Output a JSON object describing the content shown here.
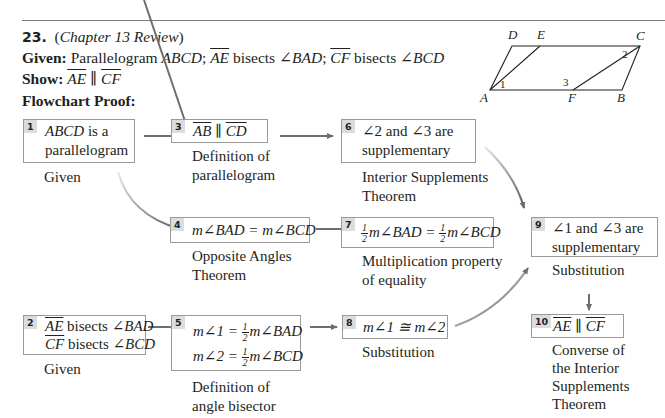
{
  "problem": {
    "number": "23.",
    "chapter_ref": "Chapter 13 Review",
    "given_label": "Given:",
    "given_text": {
      "p1": "Parallelogram ",
      "abcd": "ABCD",
      "sep1": "; ",
      "ae": "AE",
      "bisects1": " bisects ∠",
      "bad": "BAD",
      "sep2": "; ",
      "cf": "CF",
      "bisects2": " bisects ∠",
      "bcd": "BCD"
    },
    "show_label": "Show:",
    "show_text": {
      "ae": "AE",
      "par": " ∥ ",
      "cf": "CF"
    },
    "proof_label": "Flowchart Proof:"
  },
  "figure": {
    "vertices": {
      "A": "A",
      "B": "B",
      "C": "C",
      "D": "D",
      "E": "E",
      "F": "F"
    },
    "angles": {
      "a1": "1",
      "a2": "2",
      "a3": "3"
    }
  },
  "steps": [
    {
      "id": "1",
      "lines": [
        "ABCD is a",
        "parallelogram"
      ],
      "reason": [
        "Given"
      ]
    },
    {
      "id": "2",
      "lines": [
        "AE bisects ∠BAD",
        "CF bisects ∠BCD"
      ],
      "reason": [
        "Given"
      ]
    },
    {
      "id": "3",
      "lines": [
        "AB ∥ CD"
      ],
      "reason": [
        "Definition of",
        "parallelogram"
      ]
    },
    {
      "id": "4",
      "lines": [
        "m∠BAD = m∠BCD"
      ],
      "reason": [
        "Opposite Angles",
        "Theorem"
      ]
    },
    {
      "id": "5",
      "lines": [
        "m∠1 = ½m∠BAD",
        "m∠2 = ½m∠BCD"
      ],
      "reason": [
        "Definition of",
        "angle bisector"
      ]
    },
    {
      "id": "6",
      "lines": [
        "∠2 and ∠3 are",
        "supplementary"
      ],
      "reason": [
        "Interior Supplements",
        "Theorem"
      ]
    },
    {
      "id": "7",
      "lines": [
        "½m∠BAD = ½m∠BCD"
      ],
      "reason": [
        "Multiplication property",
        "of equality"
      ]
    },
    {
      "id": "8",
      "lines": [
        "m∠1 ≅ m∠2"
      ],
      "reason": [
        "Substitution"
      ]
    },
    {
      "id": "9",
      "lines": [
        "∠1 and ∠3 are",
        "supplementary"
      ],
      "reason": [
        "Substitution"
      ]
    },
    {
      "id": "10",
      "lines": [
        "AE ∥ CF"
      ],
      "reason": [
        "Converse of",
        "the Interior",
        "Supplements",
        "Theorem"
      ]
    }
  ],
  "math": {
    "half_num": "1",
    "half_den": "2",
    "m_angle": "m∠",
    "eq": " = ",
    "cong": " ≅ ",
    "par": " ∥ ",
    "angle": "∠",
    "and": " and ",
    "are": " are",
    "is_a": " is a",
    "bisects": " bisects ∠"
  },
  "colors": {
    "arrow": "#6d6e71",
    "box_border": "#9a9a9a",
    "tag_bg": "#dcdcdc",
    "text": "#231f20"
  }
}
